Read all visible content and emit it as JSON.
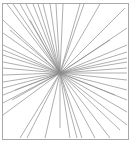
{
  "figure": {
    "width": 132,
    "height": 145,
    "frame": {
      "x": 2.5,
      "y": 3.5,
      "width": 126,
      "height": 136,
      "stroke": "#a8a8a8"
    },
    "center": {
      "x": 60,
      "y": 73
    },
    "line_color": "#8c8c8c",
    "line_width": 0.7,
    "endpoints": [
      [
        7,
        4
      ],
      [
        13,
        4
      ],
      [
        20,
        4
      ],
      [
        26,
        4
      ],
      [
        33,
        4
      ],
      [
        38,
        4
      ],
      [
        43,
        4
      ],
      [
        50,
        4
      ],
      [
        56,
        4
      ],
      [
        63,
        4
      ],
      [
        80,
        4
      ],
      [
        84,
        4
      ],
      [
        100,
        4
      ],
      [
        125,
        8
      ],
      [
        3,
        20
      ],
      [
        3,
        33
      ],
      [
        3,
        45
      ],
      [
        3,
        50
      ],
      [
        3,
        55
      ],
      [
        3,
        62
      ],
      [
        3,
        68
      ],
      [
        3,
        75
      ],
      [
        3,
        82
      ],
      [
        3,
        88
      ],
      [
        3,
        95
      ],
      [
        3,
        103
      ],
      [
        3,
        115
      ],
      [
        20,
        138
      ],
      [
        27,
        138
      ],
      [
        45,
        138
      ],
      [
        60,
        128
      ],
      [
        70,
        138
      ],
      [
        77,
        138
      ],
      [
        82,
        138
      ],
      [
        95,
        138
      ],
      [
        110,
        138
      ],
      [
        120,
        130
      ],
      [
        127,
        28
      ],
      [
        127,
        45
      ],
      [
        127,
        52
      ],
      [
        127,
        58
      ],
      [
        127,
        62
      ],
      [
        127,
        68
      ],
      [
        127,
        73
      ],
      [
        127,
        80
      ],
      [
        127,
        90
      ],
      [
        127,
        100
      ],
      [
        127,
        112
      ],
      [
        127,
        125
      ],
      [
        10,
        30
      ],
      [
        15,
        90
      ],
      [
        12,
        100
      ],
      [
        30,
        20
      ],
      [
        110,
        40
      ],
      [
        115,
        95
      ]
    ]
  }
}
